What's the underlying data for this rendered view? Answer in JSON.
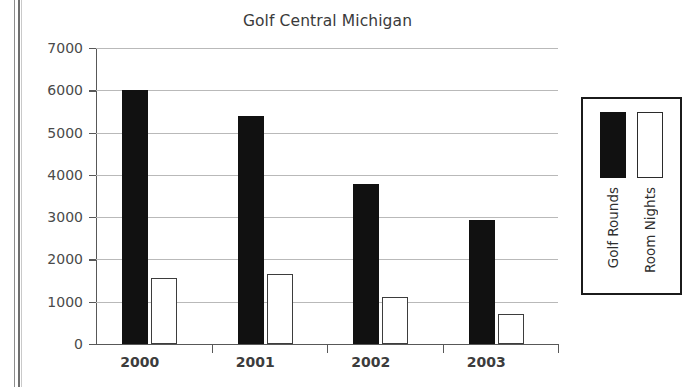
{
  "chart_data": {
    "type": "bar",
    "title": "Golf Central Michigan",
    "xlabel": "",
    "ylabel": "",
    "categories": [
      "2000",
      "2001",
      "2002",
      "2003"
    ],
    "series": [
      {
        "name": "Golf Rounds",
        "color": "#111111",
        "values": [
          6000,
          5400,
          3780,
          2930
        ]
      },
      {
        "name": "Room Nights",
        "color": "#ffffff",
        "values": [
          1560,
          1650,
          1110,
          720
        ]
      }
    ],
    "ylim": [
      0,
      7000
    ],
    "yticks": [
      0,
      1000,
      2000,
      3000,
      4000,
      5000,
      6000,
      7000
    ],
    "ytick_labels": [
      "0",
      "1000",
      "2000",
      "3000",
      "4000",
      "5000",
      "6000",
      "7000"
    ],
    "grid": true,
    "legend_position": "right"
  },
  "legend": {
    "entries": [
      {
        "label": "Golf Rounds",
        "swatch": "filled-black"
      },
      {
        "label": "Room Nights",
        "swatch": "outlined-white"
      }
    ]
  },
  "colors": {
    "series_rounds": "#111111",
    "series_nights": "#ffffff",
    "axis": "#585858",
    "gridline": "#b9b9b9",
    "title_text": "#3a3a3a",
    "background": "#ffffff"
  }
}
